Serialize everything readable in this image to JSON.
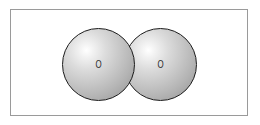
{
  "figure": {
    "name": "oxygen-molecule-diagram",
    "caption": "",
    "frame": {
      "border_color": "#9a9a9a",
      "background_color": "#ffffff"
    },
    "molecule": {
      "formula": "O2",
      "bond_type": "space-filling-overlap",
      "atoms": [
        {
          "id": "atom-left",
          "label": "O",
          "element": "Oxygen",
          "fill_color": "#c8c8c8",
          "highlight_color": "#ffffff",
          "outline_color": "#1c1c1c"
        },
        {
          "id": "atom-right",
          "label": "O",
          "element": "Oxygen",
          "fill_color": "#c8c8c8",
          "highlight_color": "#ffffff",
          "outline_color": "#1c1c1c"
        }
      ]
    }
  }
}
